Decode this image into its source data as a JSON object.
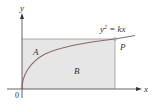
{
  "diagram": {
    "axes": {
      "x_label": "x",
      "y_label": "y",
      "origin_label": "0"
    },
    "curve": {
      "equation_lhs": "y",
      "equation_exp": "2",
      "equation_rhs": " = kx"
    },
    "regions": {
      "upper": "A",
      "lower": "B"
    },
    "point": {
      "label": "P"
    },
    "colors": {
      "region_fill": "#e8e8e8",
      "curve": "#8a6a6a",
      "axis": "#555555",
      "rect_edge": "#9a9a9a",
      "point": "#a0a0a0"
    }
  }
}
